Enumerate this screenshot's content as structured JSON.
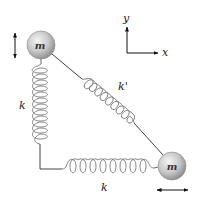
{
  "diagram": {
    "masses": [
      {
        "id": "top-left",
        "label": "m",
        "cx": 41,
        "cy": 45,
        "r": 14,
        "motion": "vertical"
      },
      {
        "id": "bottom-right",
        "label": "m",
        "cx": 172,
        "cy": 166,
        "r": 14,
        "motion": "horizontal"
      }
    ],
    "springs": [
      {
        "id": "vertical",
        "label": "k"
      },
      {
        "id": "horizontal",
        "label": "k"
      },
      {
        "id": "diagonal",
        "label": "k'"
      }
    ],
    "axes": {
      "x_label": "x",
      "y_label": "y"
    },
    "labels": {
      "spring_vertical": "k",
      "spring_horizontal": "k",
      "spring_diagonal": "k'",
      "mass_top": "m",
      "mass_bottom": "m",
      "axis_x": "x",
      "axis_y": "y"
    },
    "colors": {
      "mass_fill_light": "#f2f2f2",
      "mass_fill_dark": "#9a9a9a",
      "spring": "#777777",
      "line": "#444444",
      "arrow": "#111111"
    }
  }
}
